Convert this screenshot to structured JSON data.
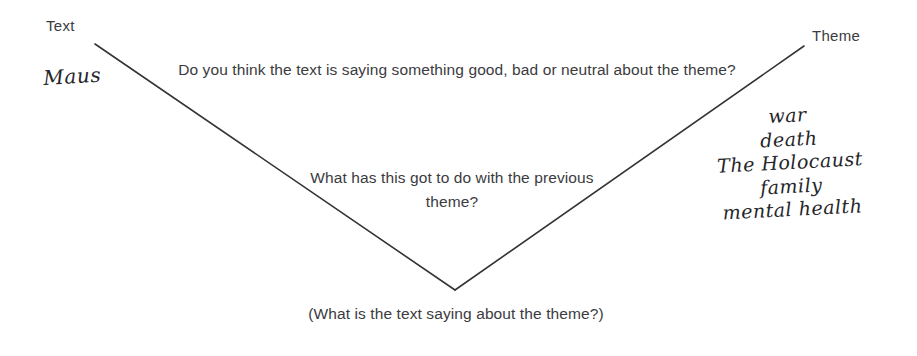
{
  "diagram": {
    "title_hidden": "",
    "background_color": "#ffffff",
    "line_color": "#333338",
    "text_color": "#3b3b40",
    "script_color": "#25252a",
    "endpoints": {
      "left_top_label": "Text",
      "right_top_label": "Theme"
    },
    "axis_labels": {
      "left": "Text",
      "right": "Theme"
    },
    "source_text": "Maus",
    "questions": [
      "Do you think the text is saying something good, bad or neutral about the theme?",
      "What has this got to do with the previous theme?"
    ],
    "caption": "(What is the text saying about the theme?)",
    "themes": [
      "war",
      "death",
      "The Holocaust",
      "family",
      "mental health"
    ],
    "vertex_label": ""
  }
}
